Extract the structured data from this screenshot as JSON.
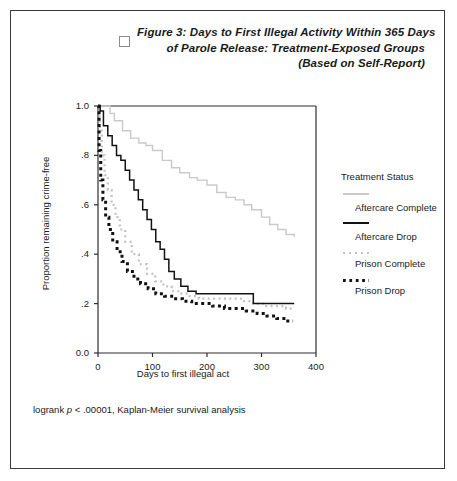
{
  "figure": {
    "checkbox_icon": "checkbox-icon",
    "title_lines": [
      "Figure 3: Days to First Illegal Activity Within 365 Days",
      "of Parole Release: Treatment-Exposed Groups",
      "(Based on Self-Report)"
    ],
    "footnote_prefix": "logrank ",
    "footnote_italic": "p",
    "footnote_suffix": " < .00001, Kaplan-Meier survival analysis"
  },
  "legend": {
    "title": "Treatment Status",
    "entries": [
      {
        "label": "Aftercare Complete",
        "style": "solid",
        "color": "#c9c9c9"
      },
      {
        "label": "Aftercare Drop",
        "style": "solid",
        "color": "#121212"
      },
      {
        "label": "Prison Complete",
        "style": "dotted",
        "color": "#c2c2c2"
      },
      {
        "label": "Prison Drop",
        "style": "dotted",
        "color": "#121212"
      }
    ]
  },
  "chart_data": {
    "type": "line",
    "title": "Figure 3: Days to First Illegal Activity Within 365 Days of Parole Release: Treatment-Exposed Groups (Based on Self-Report)",
    "xlabel": "Days to first illegal act",
    "ylabel": "Proportion remaining crime-free",
    "xlim": [
      0,
      400
    ],
    "ylim": [
      0.0,
      1.0
    ],
    "xticks": [
      0,
      100,
      200,
      300,
      400
    ],
    "xtick_labels": [
      "0",
      "100",
      "200",
      "300",
      "400"
    ],
    "yticks": [
      0.0,
      0.2,
      0.4,
      0.6,
      0.8,
      1.0
    ],
    "ytick_labels": [
      "0.0",
      ".2",
      ".4",
      ".6",
      ".8",
      "1.0"
    ],
    "grid": false,
    "legend_position": "right",
    "step_type": "post",
    "annotation": "logrank p < .00001, Kaplan-Meier survival analysis",
    "series": [
      {
        "name": "Aftercare Complete",
        "color": "#c9c9c9",
        "style": "solid",
        "x": [
          0,
          8,
          22,
          30,
          45,
          60,
          75,
          88,
          100,
          118,
          135,
          150,
          168,
          182,
          200,
          218,
          235,
          252,
          268,
          282,
          300,
          315,
          330,
          345,
          360
        ],
        "y": [
          1.0,
          1.0,
          0.97,
          0.94,
          0.9,
          0.87,
          0.85,
          0.84,
          0.82,
          0.78,
          0.75,
          0.73,
          0.71,
          0.7,
          0.68,
          0.65,
          0.63,
          0.62,
          0.6,
          0.58,
          0.55,
          0.52,
          0.5,
          0.48,
          0.47
        ]
      },
      {
        "name": "Aftercare Drop",
        "color": "#121212",
        "style": "solid",
        "x": [
          0,
          4,
          10,
          18,
          26,
          34,
          42,
          50,
          58,
          66,
          74,
          82,
          90,
          98,
          106,
          114,
          122,
          130,
          140,
          152,
          165,
          180,
          210,
          240,
          265,
          285,
          300,
          330,
          360
        ],
        "y": [
          1.0,
          0.98,
          0.92,
          0.88,
          0.84,
          0.8,
          0.78,
          0.74,
          0.7,
          0.66,
          0.62,
          0.58,
          0.54,
          0.5,
          0.45,
          0.42,
          0.38,
          0.33,
          0.3,
          0.27,
          0.25,
          0.24,
          0.24,
          0.24,
          0.24,
          0.2,
          0.2,
          0.2,
          0.2
        ]
      },
      {
        "name": "Prison Complete",
        "color": "#c2c2c2",
        "style": "dotted",
        "x": [
          0,
          3,
          7,
          12,
          18,
          25,
          32,
          40,
          50,
          62,
          75,
          90,
          105,
          120,
          135,
          150,
          168,
          185,
          205,
          225,
          245,
          265,
          285,
          305,
          325,
          345,
          360
        ],
        "y": [
          1.0,
          0.9,
          0.8,
          0.72,
          0.66,
          0.6,
          0.55,
          0.5,
          0.45,
          0.4,
          0.36,
          0.32,
          0.29,
          0.27,
          0.25,
          0.24,
          0.23,
          0.22,
          0.22,
          0.22,
          0.22,
          0.21,
          0.2,
          0.19,
          0.19,
          0.18,
          0.18
        ]
      },
      {
        "name": "Prison Drop",
        "color": "#121212",
        "style": "dotted",
        "x": [
          0,
          2,
          5,
          9,
          14,
          20,
          27,
          35,
          44,
          54,
          66,
          78,
          92,
          106,
          122,
          138,
          155,
          172,
          190,
          210,
          232,
          252,
          272,
          292,
          310,
          328,
          345,
          358
        ],
        "y": [
          1.0,
          0.82,
          0.7,
          0.62,
          0.55,
          0.5,
          0.45,
          0.41,
          0.37,
          0.33,
          0.3,
          0.28,
          0.26,
          0.24,
          0.23,
          0.22,
          0.21,
          0.2,
          0.2,
          0.19,
          0.18,
          0.18,
          0.17,
          0.16,
          0.15,
          0.14,
          0.13,
          0.13
        ]
      }
    ]
  }
}
